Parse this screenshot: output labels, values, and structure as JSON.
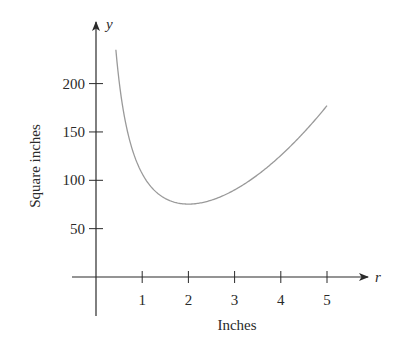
{
  "chart_data": {
    "type": "line",
    "title": "",
    "xlabel": "Inches",
    "ylabel": "Square inches",
    "x_axis_var": "r",
    "y_axis_var": "y",
    "x_ticks": [
      1,
      2,
      3,
      4,
      5
    ],
    "y_ticks": [
      50,
      100,
      150,
      200
    ],
    "xlim": [
      0,
      5.6
    ],
    "ylim": [
      0,
      250
    ],
    "grid": false,
    "legend": null,
    "series": [
      {
        "name": "surface area",
        "x": [
          0.43,
          0.5,
          0.6,
          0.75,
          1.0,
          1.25,
          1.5,
          1.75,
          2.0,
          2.5,
          3.0,
          3.5,
          4.0,
          4.5,
          5.0
        ],
        "values": [
          235,
          202,
          170,
          137,
          107,
          90,
          81,
          77,
          75,
          80,
          90,
          106,
          126,
          150,
          177
        ]
      }
    ],
    "colors": {
      "axis": "#2a2a2a",
      "curve": "#9a9a9a"
    }
  }
}
